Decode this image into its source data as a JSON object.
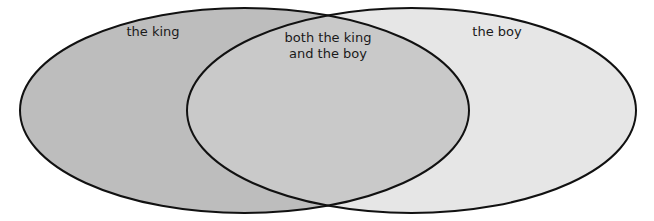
{
  "venn": {
    "left_set": {
      "label": "the king"
    },
    "right_set": {
      "label": "the boy"
    },
    "intersection": {
      "line1": "both the king",
      "line2": "and the boy"
    }
  }
}
